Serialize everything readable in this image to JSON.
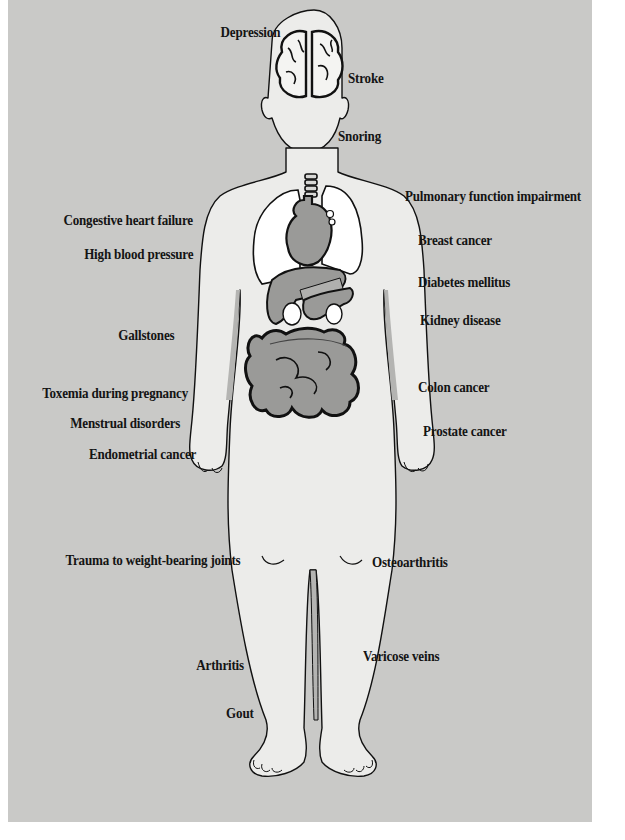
{
  "diagram": {
    "colors": {
      "background": "#c9c9c7",
      "skin": "#ececea",
      "organs": "#9a9a98",
      "lungs": "#ffffff",
      "outline": "#111111"
    },
    "labels_left": [
      {
        "text": "Depression"
      },
      {
        "text": "Congestive heart failure"
      },
      {
        "text": "High blood pressure"
      },
      {
        "text": "Gallstones"
      },
      {
        "text": "Toxemia during pregnancy"
      },
      {
        "text": "Menstrual disorders"
      },
      {
        "text": "Endometrial cancer"
      },
      {
        "text": "Trauma to weight-bearing joints"
      },
      {
        "text": "Arthritis"
      },
      {
        "text": "Gout"
      }
    ],
    "labels_right": [
      {
        "text": "Stroke"
      },
      {
        "text": "Snoring"
      },
      {
        "text": "Pulmonary function impairment"
      },
      {
        "text": "Breast cancer"
      },
      {
        "text": "Diabetes mellitus"
      },
      {
        "text": "Kidney disease"
      },
      {
        "text": "Colon cancer"
      },
      {
        "text": "Prostate cancer"
      },
      {
        "text": "Osteoarthritis"
      },
      {
        "text": "Varicose veins"
      }
    ]
  }
}
